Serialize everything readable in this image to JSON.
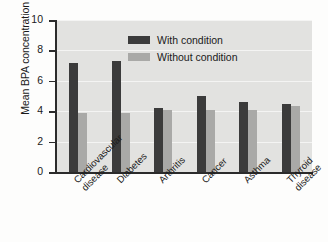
{
  "chart_data": {
    "type": "bar",
    "title": "",
    "xlabel": "",
    "ylabel": "Mean BPA concentration (ng/ml)",
    "ylim": [
      0,
      10
    ],
    "yticks": [
      0,
      2,
      4,
      6,
      8,
      10
    ],
    "ytick_labels": [
      "0",
      "2",
      "4",
      "6",
      "8",
      "10"
    ],
    "grid": true,
    "legend_position": "top-right",
    "categories": [
      "Cardiovascular\ndisease",
      "Diabetes",
      "Arthritis",
      "Cancer",
      "Asthma",
      "Thyroid\ndisease"
    ],
    "series": [
      {
        "name": "With condition",
        "color": "#3b3b3b",
        "values": [
          7.2,
          7.3,
          4.2,
          5.0,
          4.6,
          4.5
        ]
      },
      {
        "name": "Without condition",
        "color": "#a9a9a7",
        "values": [
          3.85,
          3.9,
          4.1,
          4.1,
          4.1,
          4.35
        ]
      }
    ]
  },
  "colors": {
    "plot_background": "#e2e2e0",
    "axis": "#2b2b2b",
    "page_background": "#fdfdfc",
    "with_condition": "#3b3b3b",
    "without_condition": "#a9a9a7"
  }
}
